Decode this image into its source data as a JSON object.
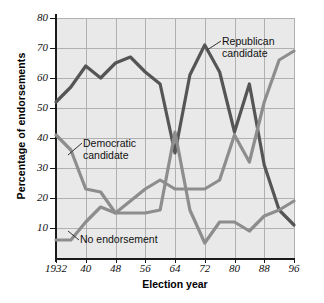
{
  "axes": {
    "ylabel": "Percentage of endorsements",
    "xlabel": "Election year",
    "yticks": [
      "10",
      "20",
      "30",
      "40",
      "50",
      "60",
      "70",
      "80"
    ],
    "xticks": [
      "1932",
      "40",
      "48",
      "56",
      "64",
      "72",
      "80",
      "88",
      "96"
    ]
  },
  "annotations": {
    "republican_line1": "Republican",
    "republican_line2": "candidate",
    "democratic_line1": "Democratic",
    "democratic_line2": "candidate",
    "no_endorsement": "No endorsement"
  },
  "colors": {
    "republican": "#555555",
    "democratic": "#8d8d8d",
    "no_endorsement": "#8d8d8d",
    "plot_background": "#e9e9e9",
    "gridline": "#b0b0b0",
    "axis": "#1a1a1a"
  },
  "chart_data": {
    "type": "line",
    "title": "",
    "xlabel": "Election year",
    "ylabel": "Percentage of endorsements",
    "xlim": [
      1932,
      1996
    ],
    "ylim": [
      0,
      80
    ],
    "grid": true,
    "legend": "annotated-inline",
    "x": [
      1932,
      1936,
      1940,
      1944,
      1948,
      1952,
      1956,
      1960,
      1964,
      1968,
      1972,
      1976,
      1980,
      1984,
      1988,
      1992,
      1996
    ],
    "series": [
      {
        "name": "Republican candidate",
        "color": "#555555",
        "values": [
          52,
          57,
          64,
          60,
          65,
          67,
          62,
          58,
          35,
          61,
          71,
          62,
          42,
          58,
          31,
          16,
          11
        ]
      },
      {
        "name": "Democratic candidate",
        "color": "#8d8d8d",
        "values": [
          41,
          36,
          23,
          22,
          15,
          15,
          15,
          16,
          42,
          16,
          5,
          12,
          12,
          9,
          14,
          16,
          19
        ]
      },
      {
        "name": "No endorsement",
        "color": "#8d8d8d",
        "values": [
          6,
          6,
          12,
          17,
          15,
          19,
          23,
          26,
          23,
          23,
          23,
          26,
          41,
          32,
          52,
          66,
          69
        ]
      }
    ]
  }
}
